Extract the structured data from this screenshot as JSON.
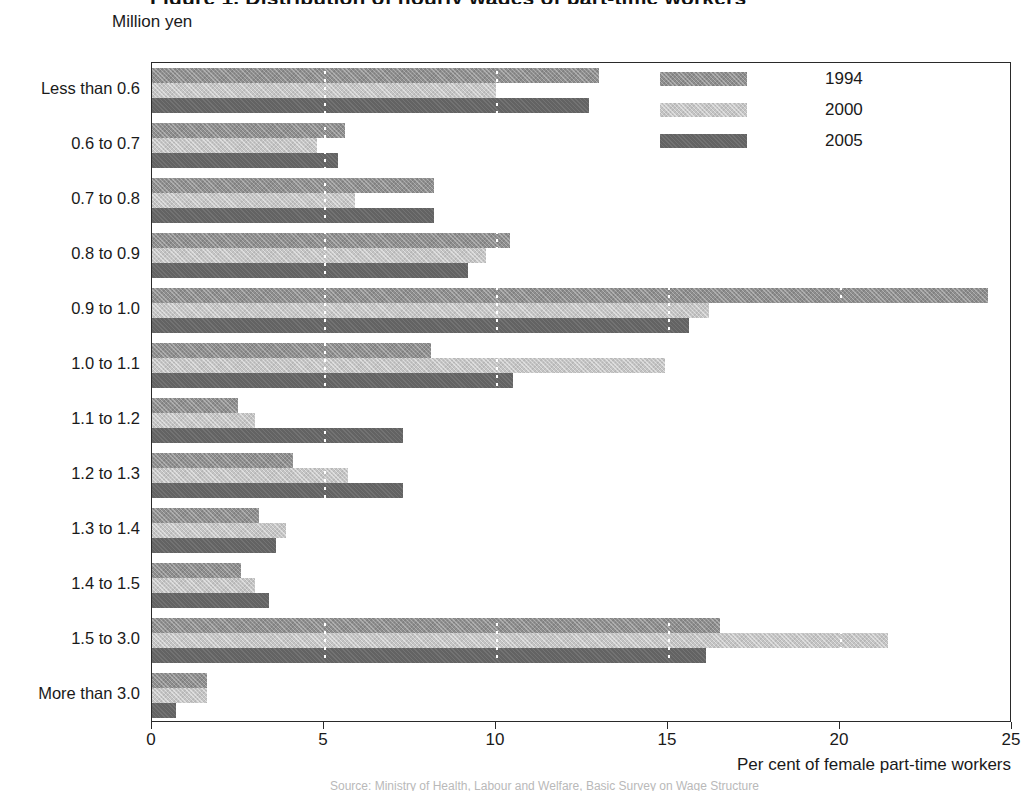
{
  "figure": {
    "title_clipped": "Figure 1. Distribution of hourly wages of part-time workers",
    "unit_label": "Million yen",
    "footer_clipped": "Source: Ministry of Health, Labour and Welfare, Basic Survey on Wage Structure"
  },
  "legend": {
    "position": "top-right",
    "items": [
      {
        "label": "1994",
        "color": "#8e8e8e",
        "pattern": "cross-hatch"
      },
      {
        "label": "2000",
        "color": "#c4c4c4",
        "pattern": "hatch"
      },
      {
        "label": "2005",
        "color": "#636363",
        "pattern": "solid"
      }
    ]
  },
  "xaxis": {
    "title": "Per cent of female part-time workers",
    "ticks": [
      "0",
      "5",
      "10",
      "15",
      "20",
      "25"
    ],
    "min": 0,
    "max": 25
  },
  "chart_data": {
    "type": "bar",
    "orientation": "horizontal",
    "title": "Figure 1. Distribution of hourly wages of part-time workers",
    "xlabel": "Per cent of female part-time workers",
    "ylabel": "Million yen",
    "xlim": [
      0,
      25
    ],
    "xticks": [
      0,
      5,
      10,
      15,
      20,
      25
    ],
    "grid": "vertical dotted white gridlines at 5, 10, 15, 20",
    "legend_position": "top-right",
    "categories": [
      "Less than 0.6",
      "0.6 to 0.7",
      "0.7 to 0.8",
      "0.8 to 0.9",
      "0.9 to 1.0",
      "1.0 to 1.1",
      "1.1 to 1.2",
      "1.2 to 1.3",
      "1.3 to 1.4",
      "1.4 to 1.5",
      "1.5 to 3.0",
      "More than 3.0"
    ],
    "series": [
      {
        "name": "1994",
        "color": "#8e8e8e",
        "values": [
          13.0,
          5.6,
          8.2,
          10.4,
          24.3,
          8.1,
          2.5,
          4.1,
          3.1,
          2.6,
          16.5,
          1.6
        ]
      },
      {
        "name": "2000",
        "color": "#c4c4c4",
        "values": [
          10.0,
          4.8,
          5.9,
          9.7,
          16.2,
          14.9,
          3.0,
          5.7,
          3.9,
          3.0,
          21.4,
          1.6
        ]
      },
      {
        "name": "2005",
        "color": "#636363",
        "values": [
          12.7,
          5.4,
          8.2,
          9.2,
          15.6,
          10.5,
          7.3,
          7.3,
          3.6,
          3.4,
          16.1,
          0.7
        ]
      }
    ]
  }
}
